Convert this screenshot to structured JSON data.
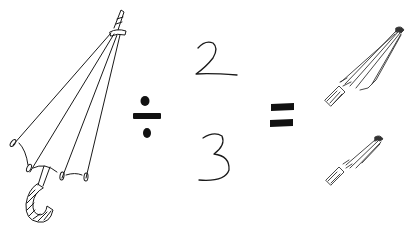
{
  "equation": {
    "left_operand": "open-umbrella",
    "operator_divide": "÷",
    "fraction": {
      "numerator": "2",
      "denominator": "3"
    },
    "operator_equals": "=",
    "result": [
      "closed-umbrella-large",
      "closed-umbrella-small"
    ]
  },
  "colors": {
    "ink": "#1a1a1a",
    "background": "#ffffff"
  }
}
